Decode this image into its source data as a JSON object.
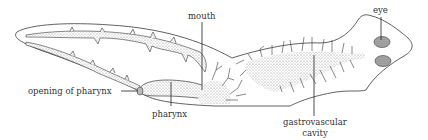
{
  "diagram": {
    "colors": {
      "line": "#3a3a3a",
      "stipple": "#9a9a9a",
      "eye_fill": "#6e6e6e",
      "background": "#ffffff"
    },
    "labels": {
      "mouth": "mouth",
      "eye": "eye",
      "opening_of_pharynx": "opening of pharynx",
      "pharynx": "pharynx",
      "gastrovascular_cavity_line1": "gastrovascular",
      "gastrovascular_cavity_line2": "cavity"
    }
  }
}
